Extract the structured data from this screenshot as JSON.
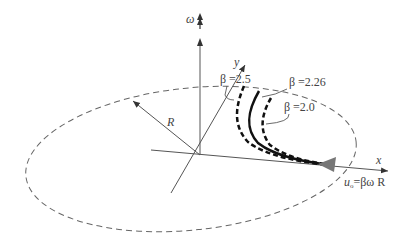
{
  "diagram": {
    "axes": {
      "omega_label": "ω",
      "x_label": "x",
      "y_label": "y",
      "radius_label": "R"
    },
    "curves": [
      {
        "name": "beta-2.5",
        "label": "β =2.5",
        "style": "dashed-bold"
      },
      {
        "name": "beta-2.26",
        "label": "β =2.26",
        "style": "solid-bold"
      },
      {
        "name": "beta-2.0",
        "label": "β =2.0",
        "style": "dashed-bold"
      }
    ],
    "velocity_label_u": "u",
    "velocity_label_sub": "o",
    "velocity_label_rest": "=βω R",
    "colors": {
      "axis": "#555555",
      "ellipse": "#666666",
      "curve": "#111111",
      "arrow_fill": "#777777",
      "text": "#444444"
    }
  }
}
